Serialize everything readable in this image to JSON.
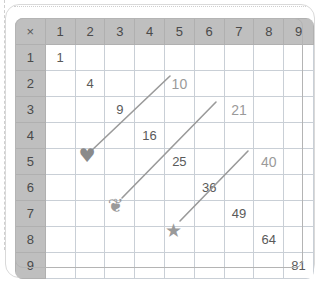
{
  "worksheet": {
    "title": "Multiplication Table Squares Worksheet",
    "cut_line": "dotted-cut-line",
    "margin_rule": "dashed-margin-line"
  },
  "table": {
    "corner_symbol": "×",
    "column_headers": [
      "1",
      "2",
      "3",
      "4",
      "5",
      "6",
      "7",
      "8",
      "9"
    ],
    "row_headers": [
      "1",
      "2",
      "3",
      "4",
      "5",
      "6",
      "7",
      "8",
      "9"
    ],
    "rows": [
      [
        "1",
        "",
        "",
        "",
        "",
        "",
        "",
        "",
        ""
      ],
      [
        "",
        "4",
        "",
        "",
        "10",
        "",
        "",
        "",
        ""
      ],
      [
        "",
        "",
        "9",
        "",
        "",
        "",
        "21",
        "",
        ""
      ],
      [
        "",
        "",
        "",
        "16",
        "",
        "",
        "",
        "",
        ""
      ],
      [
        "",
        "",
        "",
        "",
        "25",
        "",
        "",
        "40",
        ""
      ],
      [
        "",
        "",
        "",
        "",
        "",
        "36",
        "",
        "",
        ""
      ],
      [
        "",
        "",
        "",
        "",
        "",
        "",
        "49",
        "",
        ""
      ],
      [
        "",
        "",
        "",
        "",
        "",
        "",
        "",
        "64",
        ""
      ],
      [
        "",
        "",
        "",
        "",
        "",
        "",
        "",
        "",
        "81"
      ]
    ],
    "square_cells": [
      {
        "row": 1,
        "col": 1,
        "value": "1"
      },
      {
        "row": 2,
        "col": 2,
        "value": "4"
      },
      {
        "row": 3,
        "col": 3,
        "value": "9"
      },
      {
        "row": 4,
        "col": 4,
        "value": "16"
      },
      {
        "row": 5,
        "col": 5,
        "value": "25"
      },
      {
        "row": 6,
        "col": 6,
        "value": "36"
      },
      {
        "row": 7,
        "col": 7,
        "value": "49"
      },
      {
        "row": 8,
        "col": 8,
        "value": "64"
      },
      {
        "row": 9,
        "col": 9,
        "value": "81"
      }
    ],
    "target_cells": [
      {
        "row": 2,
        "col": 5,
        "value": "10"
      },
      {
        "row": 3,
        "col": 7,
        "value": "21"
      },
      {
        "row": 5,
        "col": 8,
        "value": "40"
      }
    ]
  },
  "markers": [
    {
      "name": "heart",
      "glyph": "♥",
      "row": 5,
      "col": 2,
      "color": "#8a8a8a",
      "points_to": "10"
    },
    {
      "name": "butterfly",
      "glyph": "❦",
      "row": 7,
      "col": 3,
      "color": "#9a9a9a",
      "points_to": "21"
    },
    {
      "name": "star",
      "glyph": "★",
      "row": 8,
      "col": 5,
      "color": "#9a9a9a",
      "points_to": "40"
    }
  ],
  "arrows": [
    {
      "name": "heart-to-10",
      "from_x": 90,
      "from_y": 152,
      "to_x": 170,
      "to_y": 76,
      "color": "#9a9a9a"
    },
    {
      "name": "butterfly-to-21",
      "from_x": 122,
      "from_y": 198,
      "to_x": 216,
      "to_y": 102,
      "color": "#9a9a9a"
    },
    {
      "name": "star-to-40",
      "from_x": 180,
      "from_y": 221,
      "to_x": 248,
      "to_y": 151,
      "color": "#9a9a9a"
    }
  ],
  "colors": {
    "header_bg": "#bfbfbf",
    "grid_line": "#c9cfd6",
    "text": "#4a4a4a",
    "muted_text": "#9a9a9a",
    "panel_border": "#d9d9d9",
    "page_bg": "#ffffff"
  }
}
